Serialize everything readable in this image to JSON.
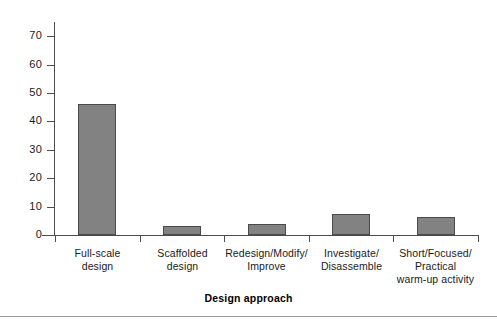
{
  "chart_data": {
    "type": "bar",
    "title": "",
    "xlabel": "Design approach",
    "ylabel": "",
    "categories": [
      "Full-scale\ndesign",
      "Scaffolded\ndesign",
      "Redesign/Modify/\nImprove",
      "Investigate/\nDisassemble",
      "Short/Focused/\nPractical\nwarm-up activity"
    ],
    "values": [
      46,
      3,
      4,
      7.5,
      6.5
    ],
    "ylim": [
      0,
      75
    ],
    "yticks": [
      0,
      10,
      20,
      30,
      40,
      50,
      60,
      70
    ],
    "ytick_labels": [
      "0",
      "10",
      "20",
      "30",
      "40",
      "50",
      "60",
      "70"
    ],
    "grid": false,
    "legend": null,
    "bar_color": "#828282",
    "bar_edge_color": "#4a4a4a",
    "axis_color": "#4d4d4d"
  }
}
